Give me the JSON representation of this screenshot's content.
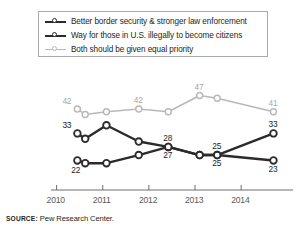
{
  "chart_data": {
    "type": "line",
    "title": "",
    "xlabel": "",
    "ylabel": "",
    "xlim": [
      2009.9,
      2014.95
    ],
    "ylim": [
      18,
      52
    ],
    "grid": false,
    "legend_position": "top",
    "x": [
      2010.45,
      2010.62,
      2011.08,
      2011.78,
      2012.42,
      2013.1,
      2013.48,
      2014.7
    ],
    "xtick_labels": [
      "2010",
      "2011",
      "2012",
      "2013",
      "2014"
    ],
    "xtick_values": [
      2010.0,
      2011.0,
      2012.0,
      2013.0,
      2014.0
    ],
    "series": [
      {
        "name": "Better border security & stronger law enforcement",
        "color": "#2b2b2b",
        "values": [
          33,
          31,
          36,
          30,
          28,
          25,
          25,
          33
        ],
        "point_labels": [
          {
            "x_index": 0,
            "value": 33,
            "text": "33",
            "position": "above-left"
          },
          {
            "x_index": 4,
            "value": 28,
            "text": "28",
            "position": "above"
          },
          {
            "x_index": 6,
            "value": 25,
            "text": "25",
            "position": "above"
          },
          {
            "x_index": 7,
            "value": 33,
            "text": "33",
            "position": "above"
          }
        ]
      },
      {
        "name": "Way for those in U.S. illegally to become citizens",
        "color": "#2b2b2b",
        "values": [
          23,
          22,
          22,
          25,
          28,
          25,
          25,
          23
        ],
        "point_labels": [
          {
            "x_index": 1,
            "value": 22,
            "text": "22",
            "position": "below-left"
          },
          {
            "x_index": 4,
            "value": 27,
            "text": "27",
            "position": "below"
          },
          {
            "x_index": 6,
            "value": 25,
            "text": "25",
            "position": "below"
          },
          {
            "x_index": 7,
            "value": 23,
            "text": "23",
            "position": "below"
          }
        ]
      },
      {
        "name": "Both should be given equal priority",
        "color": "#b8b8b8",
        "values": [
          42,
          40,
          41,
          42,
          41,
          47,
          46,
          41
        ],
        "point_labels": [
          {
            "x_index": 0,
            "value": 42,
            "text": "42",
            "position": "above-left"
          },
          {
            "x_index": 3,
            "value": 42,
            "text": "42",
            "position": "above"
          },
          {
            "x_index": 5,
            "value": 47,
            "text": "47",
            "position": "above"
          },
          {
            "x_index": 7,
            "value": 41,
            "text": "41",
            "position": "above"
          }
        ]
      }
    ]
  },
  "legend": {
    "items": [
      {
        "label": "Better border security & stronger law enforcement",
        "color": "#2b2b2b",
        "weight": 2.6,
        "marker": "open-circle"
      },
      {
        "label": "Way for those in U.S. illegally to become citizens",
        "color": "#2b2b2b",
        "weight": 2.6,
        "marker": "open-circle"
      },
      {
        "label": "Both should be given equal priority",
        "color": "#b8b8b8",
        "weight": 1.5,
        "marker": "open-circle"
      }
    ]
  },
  "axis": {
    "ticks": [
      "2010",
      "2011",
      "2012",
      "2013",
      "2014"
    ],
    "line_color": "#6d6e71"
  },
  "footer": {
    "source_keyword": "SOURCE:",
    "source_text": "Pew Research Center."
  },
  "colors": {
    "dark_series": "#2b2b2b",
    "light_series": "#b8b8b8",
    "label_dark": "#231f20",
    "label_light": "#a8a8a8",
    "axis": "#6d6e71",
    "background": "#ffffff"
  }
}
